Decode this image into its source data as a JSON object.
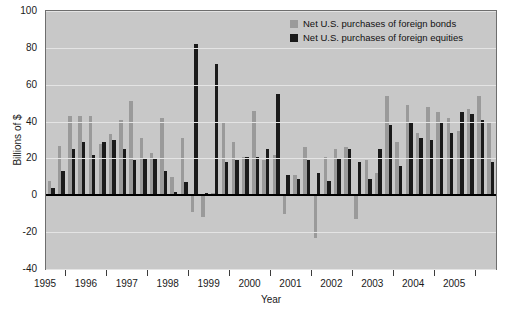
{
  "chart_data": {
    "type": "bar",
    "title": "",
    "xlabel": "Year",
    "ylabel": "Billions of $",
    "ylim": [
      -40,
      100
    ],
    "yticks": [
      100,
      80,
      60,
      40,
      20,
      0,
      -20,
      -40
    ],
    "ytick_labels": [
      "100",
      "80",
      "60",
      "40",
      "20",
      "0",
      "-20",
      "-40"
    ],
    "xtick_labels": [
      "1995",
      "1996",
      "1997",
      "1998",
      "1999",
      "2000",
      "2001",
      "2002",
      "2003",
      "2004",
      "2005"
    ],
    "grid": true,
    "legend_position": "top-right",
    "colors": {
      "bonds": "#9a9a9a",
      "equities": "#1a1a1a",
      "panel_background": "#c8c8c8",
      "gridline": "#e4e4e4",
      "zero_line": "#000000",
      "figure_background": "#ffffff",
      "axis_text": "#1a1a1a"
    },
    "categories": [
      "1995Q1",
      "1995Q2",
      "1995Q3",
      "1995Q4",
      "1996Q1",
      "1996Q2",
      "1996Q3",
      "1996Q4",
      "1997Q1",
      "1997Q2",
      "1997Q3",
      "1997Q4",
      "1998Q1",
      "1998Q2",
      "1998Q3",
      "1998Q4",
      "1999Q1",
      "1999Q2",
      "1999Q3",
      "1999Q4",
      "2000Q1",
      "2000Q2",
      "2000Q3",
      "2000Q4",
      "2001Q1",
      "2001Q2",
      "2001Q3",
      "2001Q4",
      "2002Q1",
      "2002Q2",
      "2002Q3",
      "2002Q4",
      "2003Q1",
      "2003Q2",
      "2003Q3",
      "2003Q4",
      "2004Q1",
      "2004Q2",
      "2004Q3",
      "2004Q4",
      "2005Q1",
      "2005Q2",
      "2005Q3",
      "2005Q4"
    ],
    "series": [
      {
        "name": "Net U.S. purchases of foreign bonds",
        "key": "bonds",
        "color": "#9a9a9a",
        "values": [
          8,
          27,
          43,
          43,
          43,
          28,
          33,
          41,
          51,
          31,
          23,
          42,
          10,
          31,
          -9,
          -12,
          1,
          39,
          29,
          21,
          46,
          19,
          22,
          -10,
          11,
          26,
          -23,
          21,
          25,
          26,
          -13,
          19,
          12,
          54,
          29,
          49,
          34,
          48,
          45,
          42,
          35,
          47,
          54,
          40
        ]
      },
      {
        "name": "Net U.S. purchases of foreign equities",
        "key": "equities",
        "color": "#1a1a1a",
        "values": [
          4,
          13,
          25,
          29,
          22,
          29,
          30,
          25,
          19,
          20,
          20,
          13,
          2,
          7,
          82,
          1,
          71,
          18,
          19,
          21,
          21,
          25,
          55,
          11,
          9,
          19,
          12,
          8,
          20,
          25,
          18,
          9,
          25,
          38,
          16,
          40,
          31,
          30,
          40,
          34,
          45,
          44,
          41,
          18
        ]
      }
    ],
    "legend": [
      {
        "label": "Net U.S. purchases of foreign bonds",
        "swatch": "bonds"
      },
      {
        "label": "Net U.S. purchases of foreign equities",
        "swatch": "equities"
      }
    ]
  }
}
